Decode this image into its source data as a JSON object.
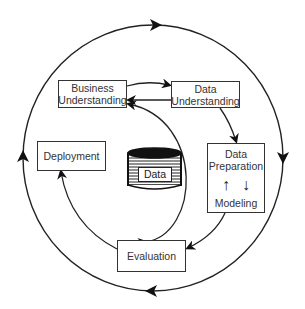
{
  "diagram": {
    "title_fragment": "",
    "nodes": {
      "business_understanding": {
        "line1": "Business",
        "line2": "Understanding"
      },
      "data_understanding": {
        "line1": "Data",
        "line2": "Understanding"
      },
      "data_preparation": {
        "line1": "Data",
        "line2": "Preparation"
      },
      "modeling": {
        "label": "Modeling"
      },
      "deployment": {
        "label": "Deployment"
      },
      "evaluation": {
        "label": "Evaluation"
      },
      "data_store": {
        "label": "Data"
      }
    },
    "prep_arrows": {
      "up": "↑",
      "down": "↓"
    },
    "edges": [
      {
        "from": "Business Understanding",
        "to": "Data Understanding"
      },
      {
        "from": "Data Understanding",
        "to": "Business Understanding"
      },
      {
        "from": "Data Understanding",
        "to": "Data Preparation"
      },
      {
        "from": "Data Preparation",
        "to": "Modeling"
      },
      {
        "from": "Modeling",
        "to": "Data Preparation"
      },
      {
        "from": "Modeling",
        "to": "Evaluation"
      },
      {
        "from": "Evaluation",
        "to": "Business Understanding"
      },
      {
        "from": "Business Understanding",
        "to": "Evaluation"
      },
      {
        "from": "Evaluation",
        "to": "Deployment"
      },
      {
        "from": "outer-cycle",
        "to": "outer-cycle",
        "direction": "clockwise"
      }
    ],
    "colors": {
      "stroke": "#222222",
      "box_border": "#333333",
      "background": "#ffffff"
    }
  }
}
